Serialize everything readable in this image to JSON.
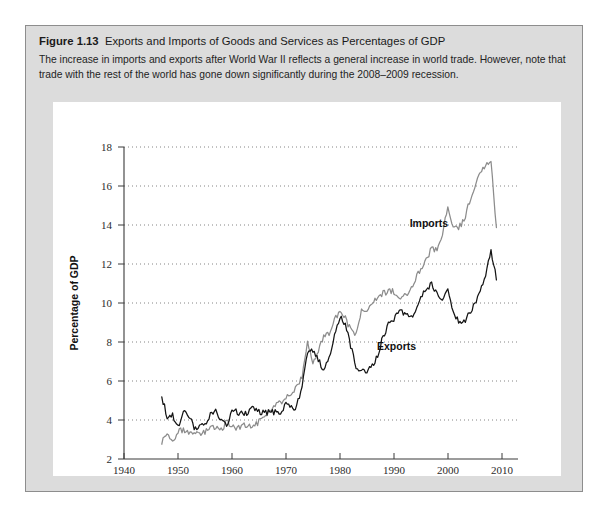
{
  "figure": {
    "number": "Figure 1.13",
    "title": "Exports and Imports of Goods and Services as Percentages of GDP",
    "caption": "The increase in imports and exports after World War II reflects a general increase in world trade. However, note that trade with the rest of the world has gone down significantly during the 2008–2009 recession."
  },
  "chart_data": {
    "type": "line",
    "title": "Exports and Imports of Goods and Services as Percentages of GDP",
    "xlabel": "Year",
    "ylabel": "Percentage of GDP",
    "xlim": [
      1940,
      2013
    ],
    "ylim": [
      2,
      18
    ],
    "xticks": [
      1940,
      1950,
      1960,
      1970,
      1980,
      1990,
      2000,
      2010
    ],
    "yticks": [
      2,
      4,
      6,
      8,
      10,
      12,
      14,
      16,
      18
    ],
    "grid": "horizontal-dotted",
    "legend": "inline-annotations",
    "annotations": [
      {
        "label": "Imports",
        "x": 1996.5,
        "y": 13.9
      },
      {
        "label": "Exports",
        "x": 1990.5,
        "y": 7.6
      }
    ],
    "colors": {
      "imports": "#8c8c8c",
      "exports": "#141414"
    },
    "x": [
      1947,
      1948,
      1949,
      1950,
      1951,
      1952,
      1953,
      1954,
      1955,
      1956,
      1957,
      1958,
      1959,
      1960,
      1961,
      1962,
      1963,
      1964,
      1965,
      1966,
      1967,
      1968,
      1969,
      1970,
      1971,
      1972,
      1973,
      1974,
      1975,
      1976,
      1977,
      1978,
      1979,
      1980,
      1981,
      1982,
      1983,
      1984,
      1985,
      1986,
      1987,
      1988,
      1989,
      1990,
      1991,
      1992,
      1993,
      1994,
      1995,
      1996,
      1997,
      1998,
      1999,
      2000,
      2001,
      2002,
      2003,
      2004,
      2005,
      2006,
      2007,
      2008,
      2009
    ],
    "series": [
      {
        "name": "Exports",
        "values": [
          5.2,
          4.2,
          4.3,
          3.6,
          4.4,
          4.2,
          3.6,
          3.7,
          3.8,
          4.3,
          4.6,
          3.9,
          3.7,
          4.5,
          4.4,
          4.3,
          4.4,
          4.6,
          4.4,
          4.4,
          4.4,
          4.4,
          4.3,
          4.9,
          4.6,
          4.7,
          5.8,
          7.4,
          7.6,
          7.1,
          6.6,
          7.1,
          8.4,
          9.3,
          8.9,
          7.8,
          6.7,
          6.6,
          6.5,
          6.8,
          7.3,
          8.3,
          8.9,
          9.2,
          9.6,
          9.5,
          9.2,
          9.6,
          10.4,
          10.6,
          11.0,
          10.4,
          10.1,
          10.7,
          9.6,
          9.0,
          9.0,
          9.5,
          9.9,
          10.5,
          11.5,
          12.7,
          11.2
        ]
      },
      {
        "name": "Imports",
        "values": [
          2.9,
          3.2,
          2.9,
          3.4,
          3.5,
          3.4,
          3.3,
          3.2,
          3.4,
          3.6,
          3.6,
          3.5,
          3.9,
          3.7,
          3.6,
          3.7,
          3.7,
          3.7,
          3.9,
          4.3,
          4.4,
          4.8,
          4.9,
          5.2,
          5.3,
          5.7,
          6.2,
          7.9,
          6.9,
          7.6,
          8.3,
          8.4,
          9.2,
          9.5,
          9.2,
          8.6,
          8.4,
          9.6,
          9.6,
          9.9,
          10.3,
          10.5,
          10.6,
          10.6,
          10.2,
          10.4,
          10.6,
          11.2,
          11.8,
          12.2,
          12.8,
          12.7,
          13.6,
          14.9,
          13.8,
          13.9,
          14.2,
          15.2,
          16.0,
          16.8,
          17.0,
          17.4,
          13.8
        ]
      }
    ]
  }
}
